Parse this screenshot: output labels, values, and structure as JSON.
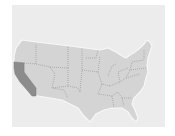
{
  "map": {
    "type": "choropleth",
    "region": "United States (contiguous)",
    "highlighted_state": "California",
    "colors": {
      "background_panel": "#ececec",
      "state_fill": "#d4d4d4",
      "highlight_fill": "#8c8c8c",
      "border": "#8f8f8f",
      "coast_outline": "#f7f7f7"
    }
  }
}
